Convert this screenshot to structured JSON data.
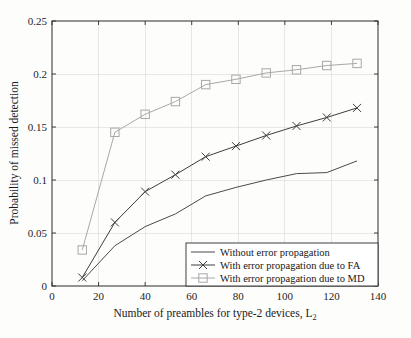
{
  "figure": {
    "background": "#fdfdfc",
    "plot_area": {
      "left": 52,
      "top": 21,
      "right": 378,
      "bottom": 286
    }
  },
  "chart_data": {
    "type": "line",
    "title": "",
    "xlabel": "Number of preambles for type-2 devices, L",
    "xlabel_subscript": "2",
    "ylabel": "Probability of missed detection",
    "xlim": [
      0,
      140
    ],
    "ylim": [
      0,
      0.25
    ],
    "xticks": [
      0,
      20,
      40,
      60,
      80,
      100,
      120,
      140
    ],
    "xtick_labels": [
      "0",
      "20",
      "40",
      "60",
      "80",
      "100",
      "120",
      "140"
    ],
    "yticks": [
      0,
      0.05,
      0.1,
      0.15,
      0.2,
      0.25
    ],
    "ytick_labels": [
      "0",
      "0.05",
      "0.1",
      "0.15",
      "0.2",
      "0.25"
    ],
    "grid": true,
    "legend_position": "lower right",
    "x": [
      13,
      27,
      40,
      53,
      66,
      79,
      92,
      105,
      118,
      131
    ],
    "series": [
      {
        "name": "Without error propagation",
        "marker": "none",
        "color": "#4a4a4a",
        "values": [
          0.005,
          0.038,
          0.056,
          0.068,
          0.085,
          0.093,
          0.1,
          0.106,
          0.107,
          0.118
        ]
      },
      {
        "name": "With error propagation due to FA",
        "marker": "x",
        "color": "#3d3d3d",
        "values": [
          0.008,
          0.06,
          0.089,
          0.105,
          0.122,
          0.132,
          0.142,
          0.151,
          0.159,
          0.168
        ]
      },
      {
        "name": "With error propagation due to MD",
        "marker": "square",
        "color": "#a8a8a8",
        "values": [
          0.034,
          0.145,
          0.162,
          0.174,
          0.19,
          0.195,
          0.201,
          0.204,
          0.208,
          0.21
        ]
      }
    ]
  },
  "legend": {
    "entries": [
      {
        "label": "Without error propagation",
        "marker": "none",
        "color": "#4a4a4a"
      },
      {
        "label": "With error propagation due to FA",
        "marker": "x",
        "color": "#3d3d3d"
      },
      {
        "label": "With error propagation due to MD",
        "marker": "square",
        "color": "#a8a8a8"
      }
    ]
  }
}
